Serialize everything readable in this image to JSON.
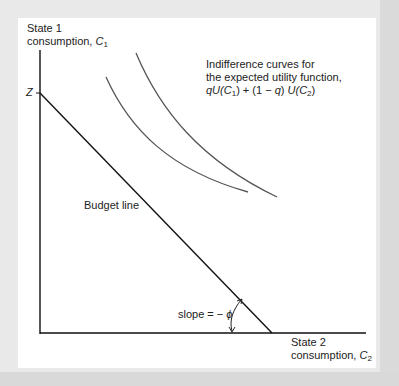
{
  "diagram": {
    "y_axis": {
      "line1": "State 1",
      "line2": "consumption, ",
      "var": "C",
      "sub": "1"
    },
    "x_axis": {
      "line1": "State 2",
      "line2": "consumption, ",
      "var": "C",
      "sub": "2"
    },
    "intercept_label": "Z",
    "budget_line_label": "Budget line",
    "indifference_label": {
      "line1": "Indifference curves for",
      "line2": "the expected utility function,",
      "formula_a": "qU",
      "formula_b": "(C",
      "formula_b_sub": "1",
      "formula_c": ") + (1 − ",
      "formula_d": "q",
      "formula_e": ") ",
      "formula_f": "U",
      "formula_g": "(C",
      "formula_g_sub": "2",
      "formula_h": ")"
    },
    "slope_label": {
      "text": "slope = − ",
      "symbol": "ϕ"
    },
    "colors": {
      "axis": "#111111",
      "budget": "#111111",
      "curve": "#555555",
      "frame": "#e9e9e9"
    }
  }
}
